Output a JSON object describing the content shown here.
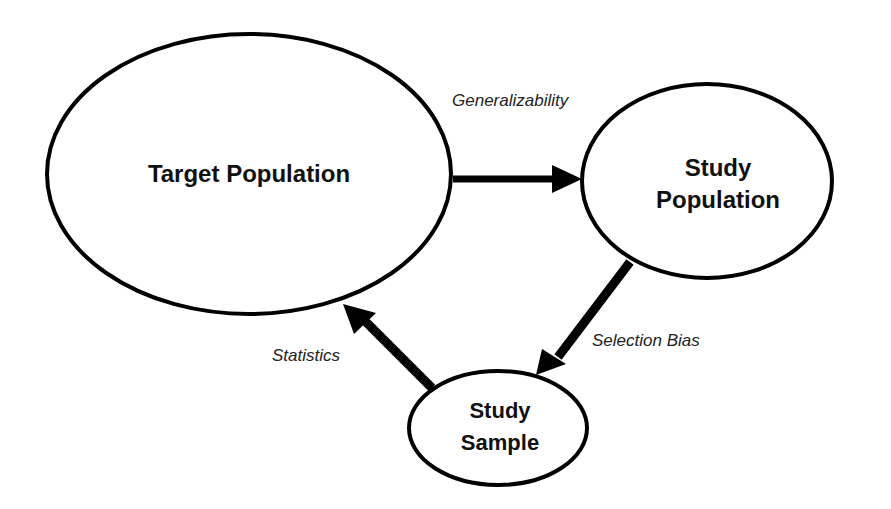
{
  "diagram": {
    "nodes": [
      {
        "id": "target",
        "label_lines": [
          "Target Population"
        ]
      },
      {
        "id": "study_pop",
        "label_lines": [
          "Study",
          "Population"
        ]
      },
      {
        "id": "sample",
        "label_lines": [
          "Study",
          "Sample"
        ]
      }
    ],
    "edges": [
      {
        "from": "target",
        "to": "study_pop",
        "label": "Generalizability"
      },
      {
        "from": "study_pop",
        "to": "sample",
        "label": "Selection Bias"
      },
      {
        "from": "sample",
        "to": "target",
        "label": "Statistics"
      }
    ],
    "colors": {
      "stroke": "#000000",
      "background": "#ffffff",
      "text": "#111111"
    }
  }
}
